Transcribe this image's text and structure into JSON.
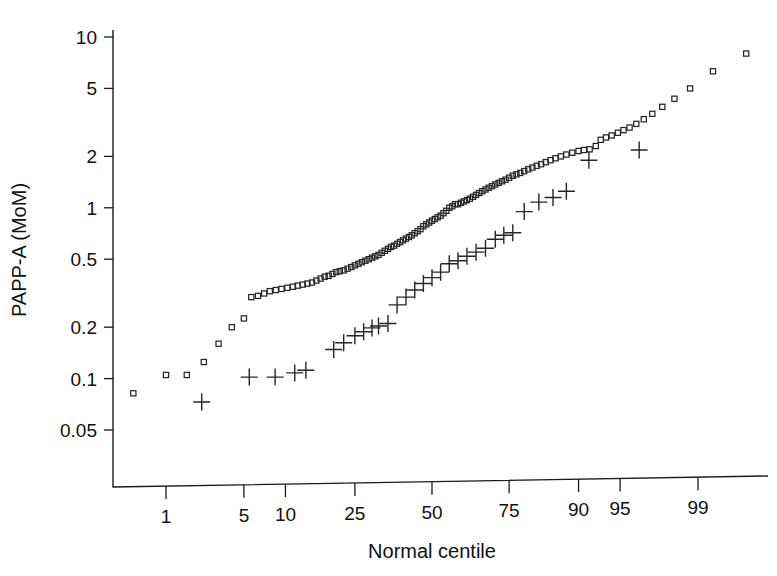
{
  "chart_data": {
    "type": "scatter",
    "title": "",
    "xlabel": "Normal centile",
    "ylabel": "PAPP-A (MoM)",
    "grid": false,
    "legend_position": "none",
    "xscale": "probit",
    "yscale": "log10",
    "xlim": [
      0.25,
      99.8
    ],
    "ylim": [
      0.042,
      11.5
    ],
    "xticks": [
      1,
      5,
      10,
      25,
      50,
      75,
      90,
      95,
      99
    ],
    "xtick_labels": [
      "1",
      "5",
      "10",
      "25",
      "50",
      "75",
      "90",
      "95",
      "99"
    ],
    "yticks": [
      0.05,
      0.1,
      0.2,
      0.5,
      1,
      2,
      5,
      10
    ],
    "ytick_labels": [
      "0.05",
      "0.1",
      "0.2",
      "0.5",
      "1",
      "2",
      "5",
      "10"
    ],
    "series": [
      {
        "name": "unaffected",
        "marker": "open-square",
        "color": "#262626",
        "points": [
          [
            0.45,
            0.082
          ],
          [
            1.0,
            0.105
          ],
          [
            1.6,
            0.105
          ],
          [
            2.3,
            0.125
          ],
          [
            3.1,
            0.16
          ],
          [
            4.0,
            0.2
          ],
          [
            5.0,
            0.225
          ],
          [
            5.7,
            0.3
          ],
          [
            6.4,
            0.305
          ],
          [
            7.1,
            0.315
          ],
          [
            7.8,
            0.325
          ],
          [
            8.6,
            0.33
          ],
          [
            9.4,
            0.335
          ],
          [
            10.3,
            0.34
          ],
          [
            11.2,
            0.345
          ],
          [
            12.0,
            0.35
          ],
          [
            12.9,
            0.355
          ],
          [
            13.8,
            0.36
          ],
          [
            14.7,
            0.365
          ],
          [
            15.6,
            0.375
          ],
          [
            16.5,
            0.385
          ],
          [
            17.4,
            0.395
          ],
          [
            18.3,
            0.4
          ],
          [
            19.2,
            0.41
          ],
          [
            20.1,
            0.42
          ],
          [
            21.0,
            0.425
          ],
          [
            22.0,
            0.43
          ],
          [
            23.0,
            0.44
          ],
          [
            24.0,
            0.45
          ],
          [
            25.0,
            0.46
          ],
          [
            26.0,
            0.47
          ],
          [
            27.0,
            0.48
          ],
          [
            28.0,
            0.49
          ],
          [
            29.0,
            0.5
          ],
          [
            30.0,
            0.51
          ],
          [
            31.0,
            0.52
          ],
          [
            32.0,
            0.53
          ],
          [
            33.0,
            0.545
          ],
          [
            34.0,
            0.56
          ],
          [
            35.0,
            0.575
          ],
          [
            36.0,
            0.59
          ],
          [
            37.0,
            0.6
          ],
          [
            38.0,
            0.615
          ],
          [
            39.0,
            0.63
          ],
          [
            40.0,
            0.645
          ],
          [
            41.0,
            0.66
          ],
          [
            42.0,
            0.675
          ],
          [
            43.0,
            0.69
          ],
          [
            44.0,
            0.71
          ],
          [
            45.0,
            0.73
          ],
          [
            46.0,
            0.75
          ],
          [
            47.0,
            0.78
          ],
          [
            48.0,
            0.8
          ],
          [
            49.0,
            0.82
          ],
          [
            50.0,
            0.84
          ],
          [
            51.0,
            0.86
          ],
          [
            52.0,
            0.88
          ],
          [
            53.0,
            0.9
          ],
          [
            54.0,
            0.93
          ],
          [
            55.0,
            0.96
          ],
          [
            56.0,
            1.0
          ],
          [
            57.0,
            1.02
          ],
          [
            58.0,
            1.05
          ],
          [
            59.0,
            1.05
          ],
          [
            60.0,
            1.07
          ],
          [
            61.0,
            1.09
          ],
          [
            62.0,
            1.11
          ],
          [
            63.0,
            1.13
          ],
          [
            64.0,
            1.16
          ],
          [
            65.0,
            1.19
          ],
          [
            66.0,
            1.22
          ],
          [
            67.0,
            1.25
          ],
          [
            68.0,
            1.28
          ],
          [
            69.0,
            1.31
          ],
          [
            70.0,
            1.34
          ],
          [
            71.0,
            1.37
          ],
          [
            72.0,
            1.4
          ],
          [
            73.0,
            1.43
          ],
          [
            74.0,
            1.46
          ],
          [
            75.0,
            1.5
          ],
          [
            76.0,
            1.54
          ],
          [
            77.0,
            1.57
          ],
          [
            78.0,
            1.6
          ],
          [
            79.0,
            1.64
          ],
          [
            80.0,
            1.68
          ],
          [
            81.0,
            1.72
          ],
          [
            82.0,
            1.76
          ],
          [
            83.0,
            1.8
          ],
          [
            84.0,
            1.85
          ],
          [
            85.0,
            1.9
          ],
          [
            86.0,
            1.95
          ],
          [
            87.0,
            2.0
          ],
          [
            88.0,
            2.05
          ],
          [
            89.0,
            2.1
          ],
          [
            90.0,
            2.15
          ],
          [
            90.8,
            2.18
          ],
          [
            91.6,
            2.2
          ],
          [
            92.4,
            2.3
          ],
          [
            93.0,
            2.5
          ],
          [
            93.6,
            2.58
          ],
          [
            94.2,
            2.65
          ],
          [
            94.8,
            2.75
          ],
          [
            95.3,
            2.85
          ],
          [
            95.8,
            2.95
          ],
          [
            96.3,
            3.1
          ],
          [
            96.8,
            3.3
          ],
          [
            97.3,
            3.55
          ],
          [
            97.8,
            3.9
          ],
          [
            98.3,
            4.35
          ],
          [
            98.8,
            5.0
          ],
          [
            99.3,
            6.3
          ],
          [
            99.7,
            8.0
          ]
        ]
      },
      {
        "name": "Down syndrome",
        "marker": "plus",
        "color": "#262626",
        "points": [
          [
            2.2,
            0.073
          ],
          [
            5.5,
            0.102
          ],
          [
            8.5,
            0.102
          ],
          [
            11.5,
            0.108
          ],
          [
            13.5,
            0.112
          ],
          [
            19.5,
            0.148
          ],
          [
            22.0,
            0.162
          ],
          [
            25.0,
            0.178
          ],
          [
            27.5,
            0.188
          ],
          [
            30.0,
            0.198
          ],
          [
            32.0,
            0.203
          ],
          [
            35.0,
            0.21
          ],
          [
            38.0,
            0.27
          ],
          [
            41.0,
            0.3
          ],
          [
            44.0,
            0.33
          ],
          [
            47.0,
            0.36
          ],
          [
            50.0,
            0.39
          ],
          [
            53.0,
            0.42
          ],
          [
            56.0,
            0.47
          ],
          [
            59.0,
            0.49
          ],
          [
            62.0,
            0.52
          ],
          [
            65.0,
            0.55
          ],
          [
            68.0,
            0.58
          ],
          [
            71.0,
            0.655
          ],
          [
            73.5,
            0.69
          ],
          [
            76.0,
            0.715
          ],
          [
            79.0,
            0.95
          ],
          [
            82.5,
            1.08
          ],
          [
            85.5,
            1.15
          ],
          [
            88.0,
            1.25
          ],
          [
            91.5,
            1.9
          ],
          [
            96.5,
            2.18
          ]
        ]
      }
    ]
  },
  "geometry": {
    "plot_left": 113,
    "plot_right": 768,
    "plot_top": 30,
    "plot_bottom": 487,
    "x_axis_right_rise": 11
  }
}
